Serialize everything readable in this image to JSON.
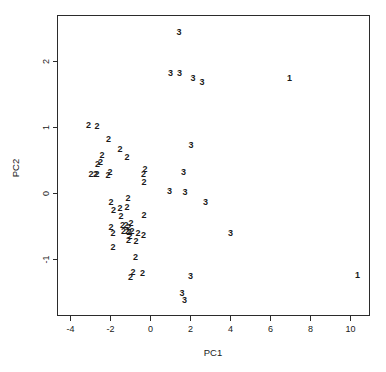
{
  "chart_data": {
    "type": "scatter",
    "title": "",
    "xlabel": "PC1",
    "ylabel": "PC2",
    "xlim": [
      -4.6,
      11.0
    ],
    "ylim": [
      -1.85,
      2.68
    ],
    "grid": false,
    "legend": null,
    "xticks": [
      -4,
      -2,
      0,
      2,
      4,
      6,
      8,
      10
    ],
    "xtick_labels": [
      "-4",
      "-2",
      "0",
      "2",
      "4",
      "6",
      "8",
      "10"
    ],
    "yticks": [
      2,
      1,
      0,
      -1
    ],
    "ytick_labels": [
      "2",
      "1",
      "0",
      "-1"
    ],
    "marker_style": "group-label-text",
    "series": [
      {
        "name": "1",
        "label": "1",
        "points": [
          {
            "x": 7.0,
            "y": 1.72
          },
          {
            "x": 10.4,
            "y": -1.25
          }
        ]
      },
      {
        "name": "2",
        "label": "2",
        "points": [
          {
            "x": -3.05,
            "y": 1.02
          },
          {
            "x": -2.62,
            "y": 1.0
          },
          {
            "x": -2.05,
            "y": 0.81
          },
          {
            "x": -1.48,
            "y": 0.65
          },
          {
            "x": -1.12,
            "y": 0.53
          },
          {
            "x": -2.38,
            "y": 0.56
          },
          {
            "x": -2.45,
            "y": 0.46
          },
          {
            "x": -2.6,
            "y": 0.43
          },
          {
            "x": -2.92,
            "y": 0.28
          },
          {
            "x": -2.7,
            "y": 0.28
          },
          {
            "x": -2.62,
            "y": 0.28
          },
          {
            "x": -2.08,
            "y": 0.26
          },
          {
            "x": -1.98,
            "y": 0.3
          },
          {
            "x": -0.22,
            "y": 0.36
          },
          {
            "x": -0.3,
            "y": 0.28
          },
          {
            "x": -0.28,
            "y": 0.16
          },
          {
            "x": -1.92,
            "y": -0.14
          },
          {
            "x": -1.08,
            "y": -0.08
          },
          {
            "x": -1.12,
            "y": -0.22
          },
          {
            "x": -1.8,
            "y": -0.26
          },
          {
            "x": -1.48,
            "y": -0.24
          },
          {
            "x": -1.42,
            "y": -0.36
          },
          {
            "x": -0.28,
            "y": -0.34
          },
          {
            "x": -1.92,
            "y": -0.52
          },
          {
            "x": -1.35,
            "y": -0.5
          },
          {
            "x": -1.18,
            "y": -0.5
          },
          {
            "x": -1.02,
            "y": -0.52
          },
          {
            "x": -0.92,
            "y": -0.46
          },
          {
            "x": -1.82,
            "y": -0.62
          },
          {
            "x": -1.3,
            "y": -0.58
          },
          {
            "x": -1.1,
            "y": -0.58
          },
          {
            "x": -1.02,
            "y": -0.6
          },
          {
            "x": -0.88,
            "y": -0.58
          },
          {
            "x": -0.98,
            "y": -0.66
          },
          {
            "x": -0.58,
            "y": -0.62
          },
          {
            "x": -0.3,
            "y": -0.64
          },
          {
            "x": -1.05,
            "y": -0.72
          },
          {
            "x": -0.68,
            "y": -0.74
          },
          {
            "x": -1.82,
            "y": -0.82
          },
          {
            "x": -0.7,
            "y": -0.98
          },
          {
            "x": -0.82,
            "y": -1.2
          },
          {
            "x": -0.95,
            "y": -1.28
          },
          {
            "x": -0.35,
            "y": -1.22
          }
        ]
      },
      {
        "name": "3",
        "label": "3",
        "points": [
          {
            "x": 1.48,
            "y": 2.42
          },
          {
            "x": 1.05,
            "y": 1.8
          },
          {
            "x": 1.5,
            "y": 1.8
          },
          {
            "x": 2.18,
            "y": 1.72
          },
          {
            "x": 2.62,
            "y": 1.66
          },
          {
            "x": 2.08,
            "y": 0.72
          },
          {
            "x": 1.7,
            "y": 0.3
          },
          {
            "x": 1.0,
            "y": 0.02
          },
          {
            "x": 1.78,
            "y": 0.0
          },
          {
            "x": 2.8,
            "y": -0.15
          },
          {
            "x": 4.05,
            "y": -0.62
          },
          {
            "x": 2.05,
            "y": -1.26
          },
          {
            "x": 1.62,
            "y": -1.52
          },
          {
            "x": 1.75,
            "y": -1.62
          }
        ]
      }
    ]
  },
  "axes": {
    "x_title": "PC1",
    "y_title": "PC2"
  }
}
